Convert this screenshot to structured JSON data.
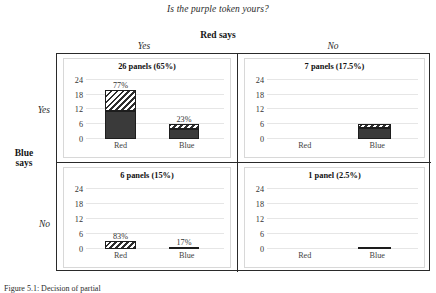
{
  "figure": {
    "suptitle": "Is the purple token yours?",
    "column_group_label": "Red says",
    "row_group_label_line1": "Blue",
    "row_group_label_line2": "says",
    "column_labels": [
      "Yes",
      "No"
    ],
    "row_labels": [
      "Yes",
      "No"
    ],
    "caption": "Figure 5.1: Decision of partial"
  },
  "chart_data": {
    "type": "bar",
    "title": "Is the purple token yours?",
    "xlabel": "Red says",
    "ylabel": "Blue says",
    "ylim": [
      0,
      26
    ],
    "yticks": [
      0,
      6,
      12,
      18,
      24
    ],
    "grid": true,
    "legend": "none",
    "categories": [
      "Red",
      "Blue"
    ],
    "segment_names": [
      "solid",
      "hatched"
    ],
    "panels": [
      {
        "row": "Yes",
        "column": "Yes",
        "title": "26 panels (65%)",
        "count": 26,
        "share_pct": 65,
        "yticks": [
          "24",
          "18",
          "12",
          "6",
          "0"
        ],
        "bars": [
          {
            "category": "Red",
            "label": "77%",
            "value_pct": 77,
            "total": 20,
            "segments": [
              {
                "type": "solid",
                "value": 11.5
              },
              {
                "type": "hatch",
                "value": 8.5
              }
            ]
          },
          {
            "category": "Blue",
            "label": "23%",
            "value_pct": 23,
            "total": 6,
            "segments": [
              {
                "type": "solid",
                "value": 4.0
              },
              {
                "type": "hatch",
                "value": 2.0
              }
            ]
          }
        ]
      },
      {
        "row": "Yes",
        "column": "No",
        "title": "7 panels (17.5%)",
        "count": 7,
        "share_pct": 17.5,
        "yticks": [
          "24",
          "18",
          "12",
          "6",
          "0"
        ],
        "bars": [
          {
            "category": "Red",
            "label": "",
            "value_pct": 0,
            "total": 0,
            "segments": []
          },
          {
            "category": "Blue",
            "label": "",
            "value_pct": 100,
            "total": 6.3,
            "segments": [
              {
                "type": "solid",
                "value": 4.6
              },
              {
                "type": "hatch",
                "value": 1.7
              }
            ]
          }
        ]
      },
      {
        "row": "No",
        "column": "Yes",
        "title": "6 panels (15%)",
        "count": 6,
        "share_pct": 15,
        "yticks": [
          "24",
          "18",
          "12",
          "6",
          "0"
        ],
        "bars": [
          {
            "category": "Red",
            "label": "83%",
            "value_pct": 83,
            "total": 3.4,
            "segments": [
              {
                "type": "hatch",
                "value": 3.4
              }
            ]
          },
          {
            "category": "Blue",
            "label": "17%",
            "value_pct": 17,
            "total": 0.8,
            "segments": [
              {
                "type": "hatch",
                "value": 0.8
              }
            ]
          }
        ]
      },
      {
        "row": "No",
        "column": "No",
        "title": "1 panel (2.5%)",
        "count": 1,
        "share_pct": 2.5,
        "yticks": [
          "24",
          "18",
          "12",
          "6",
          "0"
        ],
        "bars": [
          {
            "category": "Red",
            "label": "",
            "value_pct": 0,
            "total": 0,
            "segments": []
          },
          {
            "category": "Blue",
            "label": "",
            "value_pct": 100,
            "total": 0.7,
            "segments": [
              {
                "type": "hatch",
                "value": 0.7
              }
            ]
          }
        ]
      }
    ]
  }
}
